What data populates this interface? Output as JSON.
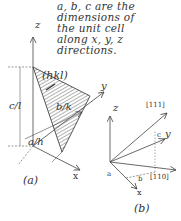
{
  "note": {
    "lines": [
      "a, b, c are the",
      "dimensions of",
      "the unit cell",
      "along x, y, z",
      "directions."
    ]
  },
  "figure_a": {
    "caption": "(a)",
    "plane_label": "(hkl)",
    "axis_labels": {
      "z": "z",
      "y": "y",
      "x": "x"
    },
    "intercepts": {
      "c": "c/l",
      "b": "b/k",
      "a": "a/h"
    }
  },
  "figure_b": {
    "caption": "(b)",
    "axis_labels": {
      "z": "z",
      "y": "y",
      "x": "x"
    },
    "directions": {
      "d111": "[111]",
      "d110": "[110]"
    },
    "edge_labels": {
      "a": "a",
      "b": "b",
      "c": "c"
    }
  },
  "colors": {
    "line": "#444444",
    "text": "#333333",
    "hatch": "#555555"
  }
}
